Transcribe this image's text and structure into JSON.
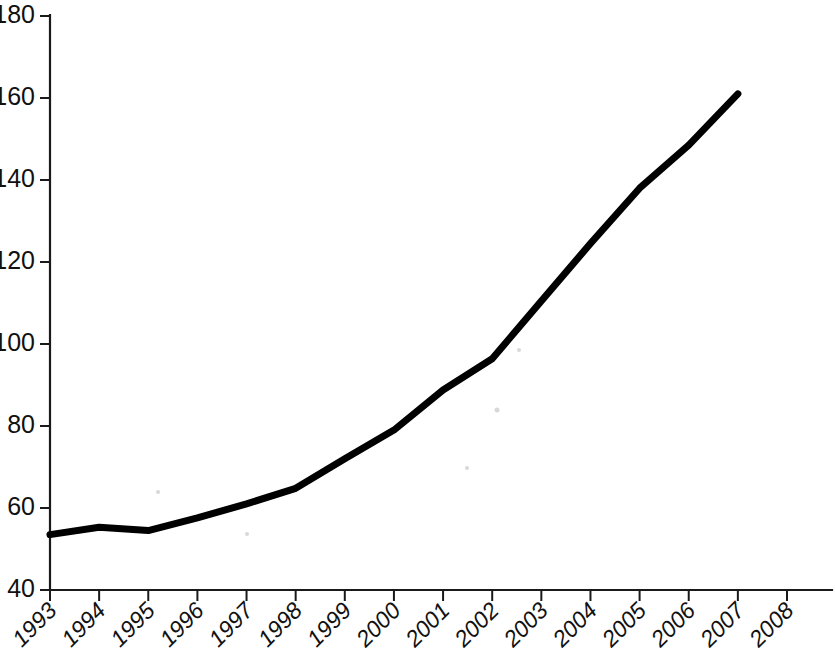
{
  "chart_data": {
    "type": "line",
    "title": "",
    "subtitle": "",
    "xlabel": "",
    "ylabel": "",
    "categories": [
      "1993",
      "1994",
      "1995",
      "1996",
      "1997",
      "1998",
      "1999",
      "2000",
      "2001",
      "2002",
      "2003",
      "2004",
      "2005",
      "2006",
      "2007",
      "2008"
    ],
    "x_tick_labels": [
      "1993",
      "1994",
      "1995",
      "1996",
      "1997",
      "1998",
      "1999",
      "2000",
      "2001",
      "2002",
      "2003",
      "2004",
      "2005",
      "2006",
      "2007",
      "2008"
    ],
    "y_tick_labels": [
      "40",
      "60",
      "80",
      "100",
      "120",
      "140",
      "160",
      "180"
    ],
    "y_ticks": [
      40,
      60,
      80,
      100,
      120,
      140,
      160,
      180
    ],
    "ylim": [
      40,
      180
    ],
    "xlim": [
      "1993",
      "2008"
    ],
    "grid": false,
    "legend": false,
    "legend_position": "none",
    "line_color": "#000000",
    "series": [
      {
        "name": "series-1",
        "x": [
          "1993",
          "1994",
          "1995",
          "1996",
          "1997",
          "1998",
          "1999",
          "2000",
          "2001",
          "2002",
          "2003",
          "2004",
          "2005",
          "2006",
          "2007"
        ],
        "values": [
          53.5,
          55.3,
          54.5,
          57.6,
          61.0,
          64.8,
          72.0,
          79.0,
          88.8,
          96.4,
          110.5,
          124.5,
          138.0,
          148.5,
          161.0
        ]
      }
    ],
    "annotations": []
  },
  "axes": {
    "x_axis_label_rotation_degrees": 45,
    "y_axis_label_rotation_degrees": 0,
    "tick_direction": "out"
  }
}
